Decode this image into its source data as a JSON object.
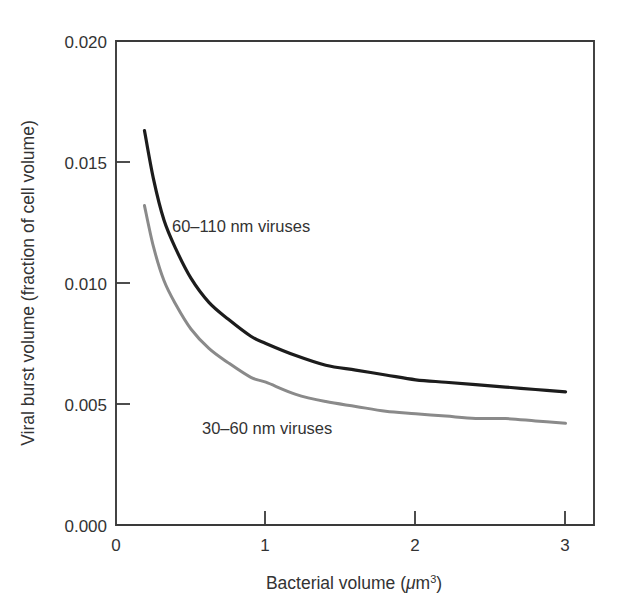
{
  "chart_data": {
    "type": "line",
    "title": "",
    "xlabel": "Bacterial volume (μm³)",
    "ylabel": "Viral burst volume (fraction of cell volume)",
    "xlim": [
      0,
      3.19
    ],
    "ylim": [
      0,
      0.02
    ],
    "xticks": [
      0,
      1,
      2,
      3
    ],
    "xticklabels": [
      "0",
      "1",
      "2",
      "3"
    ],
    "yticks": [
      0.0,
      0.005,
      0.01,
      0.015,
      0.02
    ],
    "yticklabels": [
      "0.000",
      "0.005",
      "0.010",
      "0.015",
      "0.020"
    ],
    "grid": false,
    "legend": "inline-annotations",
    "series": [
      {
        "name": "60–110 nm viruses",
        "color": "#1c1c1c",
        "linewidth": 3.2,
        "x": [
          0.19,
          0.25,
          0.32,
          0.4,
          0.5,
          0.62,
          0.75,
          0.9,
          1.0,
          1.2,
          1.4,
          1.6,
          1.8,
          2.0,
          2.2,
          2.4,
          2.6,
          2.8,
          3.0
        ],
        "y": [
          0.0163,
          0.0143,
          0.0126,
          0.0114,
          0.0102,
          0.0092,
          0.0085,
          0.0078,
          0.0075,
          0.007,
          0.0066,
          0.0064,
          0.0062,
          0.006,
          0.0059,
          0.0058,
          0.0057,
          0.0056,
          0.0055
        ]
      },
      {
        "name": "30–60 nm viruses",
        "color": "#8a8a8a",
        "linewidth": 3.0,
        "x": [
          0.19,
          0.25,
          0.32,
          0.4,
          0.5,
          0.62,
          0.75,
          0.9,
          1.0,
          1.2,
          1.4,
          1.6,
          1.8,
          2.0,
          2.2,
          2.4,
          2.6,
          2.8,
          3.0
        ],
        "y": [
          0.0132,
          0.0115,
          0.0101,
          0.0091,
          0.0081,
          0.0073,
          0.0067,
          0.0061,
          0.0059,
          0.0054,
          0.0051,
          0.0049,
          0.0047,
          0.0046,
          0.0045,
          0.0044,
          0.0044,
          0.0043,
          0.0042
        ]
      }
    ],
    "annotations": [
      {
        "text": "60–110 nm viruses",
        "x": 1.0,
        "y": 0.0122,
        "color": "#333333"
      },
      {
        "text": "30–60 nm viruses",
        "x": 0.57,
        "y": 0.0045,
        "color": "#333333"
      }
    ]
  },
  "axis": {
    "x_title_main": "Bacterial volume (",
    "x_title_mu": "μ",
    "x_title_m": "m",
    "x_title_exp": "3",
    "x_title_close": ")",
    "y_title": "Viral burst volume (fraction of cell volume)"
  }
}
